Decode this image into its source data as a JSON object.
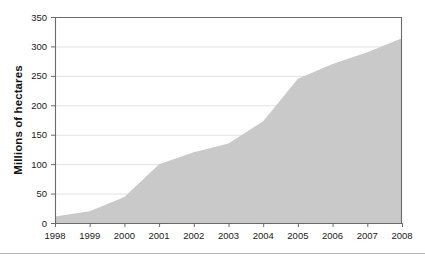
{
  "chart_data": {
    "type": "area",
    "title": "",
    "xlabel": "",
    "ylabel": "Millions of hectares",
    "categories": [
      "1998",
      "1999",
      "2000",
      "2001",
      "2002",
      "2003",
      "2004",
      "2005",
      "2006",
      "2007",
      "2008"
    ],
    "x": [
      1998,
      1999,
      2000,
      2001,
      2002,
      2003,
      2004,
      2005,
      2006,
      2007,
      2008
    ],
    "values": [
      11,
      20,
      44,
      100,
      120,
      135,
      173,
      245,
      270,
      290,
      314
    ],
    "xlim": [
      1998,
      2008
    ],
    "ylim": [
      0,
      350
    ],
    "ytick_labels": [
      "0",
      "50",
      "100",
      "150",
      "200",
      "250",
      "300",
      "350"
    ],
    "yticks": [
      0,
      50,
      100,
      150,
      200,
      250,
      300,
      350
    ],
    "grid": true,
    "legend": false,
    "legend_position": "none",
    "series": [
      {
        "name": "Millions of hectares",
        "values": [
          11,
          20,
          44,
          100,
          120,
          135,
          173,
          245,
          270,
          290,
          314
        ]
      }
    ],
    "colors": {
      "area_fill": "#c9c9c9",
      "gridline": "#d9d9d9",
      "axis": "#6b6b6b",
      "text": "#1a1a1a",
      "background": "#ffffff"
    }
  },
  "axes": {
    "y_title": "Millions of hectares"
  }
}
